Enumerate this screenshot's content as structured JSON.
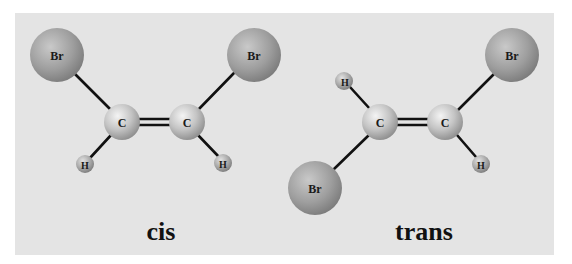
{
  "figure": {
    "background_color": "#e4e4e4",
    "molecules": [
      {
        "name": "cis",
        "label": "cis",
        "atoms": [
          {
            "id": "br1",
            "element": "Br",
            "label": "Br"
          },
          {
            "id": "br2",
            "element": "Br",
            "label": "Br"
          },
          {
            "id": "c1",
            "element": "C",
            "label": "C"
          },
          {
            "id": "c2",
            "element": "C",
            "label": "C"
          },
          {
            "id": "h1",
            "element": "H",
            "label": "H"
          },
          {
            "id": "h2",
            "element": "H",
            "label": "H"
          }
        ],
        "bonds": [
          {
            "from": "br1",
            "to": "c1",
            "order": 1
          },
          {
            "from": "br2",
            "to": "c2",
            "order": 1
          },
          {
            "from": "c1",
            "to": "c2",
            "order": 2
          },
          {
            "from": "c1",
            "to": "h1",
            "order": 1
          },
          {
            "from": "c2",
            "to": "h2",
            "order": 1
          }
        ]
      },
      {
        "name": "trans",
        "label": "trans",
        "atoms": [
          {
            "id": "br1",
            "element": "Br",
            "label": "Br"
          },
          {
            "id": "br2",
            "element": "Br",
            "label": "Br"
          },
          {
            "id": "c1",
            "element": "C",
            "label": "C"
          },
          {
            "id": "c2",
            "element": "C",
            "label": "C"
          },
          {
            "id": "h1",
            "element": "H",
            "label": "H"
          },
          {
            "id": "h2",
            "element": "H",
            "label": "H"
          }
        ],
        "bonds": [
          {
            "from": "c1",
            "to": "h1",
            "order": 1
          },
          {
            "from": "c1",
            "to": "br1",
            "order": 1
          },
          {
            "from": "c1",
            "to": "c2",
            "order": 2
          },
          {
            "from": "c2",
            "to": "br2",
            "order": 1
          },
          {
            "from": "c2",
            "to": "h2",
            "order": 1
          }
        ]
      }
    ]
  }
}
